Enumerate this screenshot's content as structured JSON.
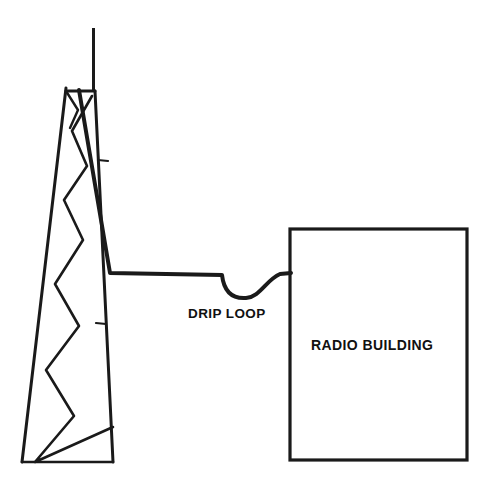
{
  "diagram": {
    "background_color": "#ffffff",
    "stroke_color": "#1a1a1a",
    "labels": {
      "drip_loop": "DRIP LOOP",
      "radio_building": "RADIO BUILDING"
    },
    "elements": {
      "mast": {
        "name": "vertical-mast",
        "x": 93,
        "y_top": 28,
        "y_bottom": 91,
        "stroke_width": 3
      },
      "tower": {
        "name": "lattice-tower",
        "top_left_x": 66,
        "top_right_x": 95,
        "top_y": 88,
        "base_left_x": 22,
        "base_right_x": 113,
        "base_y": 462,
        "stroke_width": 3,
        "brace_stroke_width": 2.6,
        "cap_y": 91
      },
      "cable": {
        "name": "transmission-line-cable",
        "stroke_width": 4,
        "start_x": 79,
        "start_y": 90,
        "bend_x": 110,
        "bend_y": 275,
        "horizontal_end_x": 222,
        "loop_bottom_y": 296,
        "loop_start_x": 222,
        "loop_end_x": 274,
        "wall_entry_x": 291,
        "wall_entry_y": 273
      },
      "building": {
        "name": "radio-building",
        "x": 290,
        "y": 229,
        "width": 177,
        "height": 231,
        "stroke_width": 3.2,
        "fill": "#ffffff"
      }
    }
  }
}
